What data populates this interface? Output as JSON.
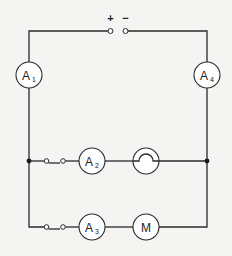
{
  "diagram": {
    "type": "circuit",
    "battery": {
      "positive_label": "+",
      "negative_label": "−"
    },
    "components": {
      "ammeter_1": {
        "letter": "A",
        "subscript": "1"
      },
      "ammeter_2": {
        "letter": "A",
        "subscript": "2"
      },
      "ammeter_3": {
        "letter": "A",
        "subscript": "3"
      },
      "ammeter_4": {
        "letter": "A",
        "subscript": "4"
      },
      "bulb": {
        "kind": "lamp"
      },
      "motor": {
        "letter": "M"
      },
      "switch_1": {
        "kind": "switch",
        "state": "closed"
      },
      "switch_2": {
        "kind": "switch",
        "state": "closed"
      }
    },
    "colors": {
      "wire": "#2a2a2a",
      "background": "#f4f4f2"
    }
  }
}
